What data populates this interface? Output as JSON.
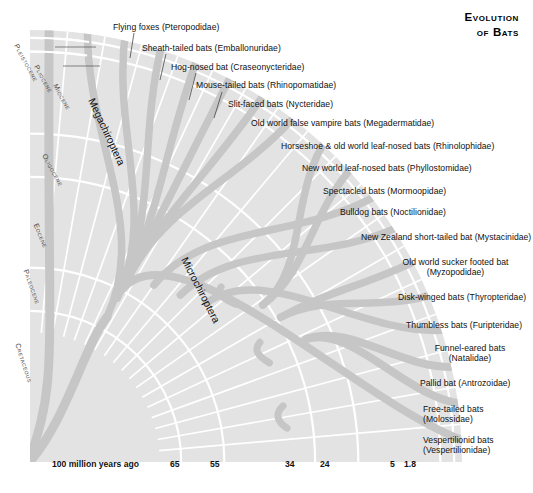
{
  "title": {
    "line1": "Evolution",
    "line2": "of Bats"
  },
  "clades": [
    {
      "name": "Megachiroptera"
    },
    {
      "name": "Microchiroptera"
    }
  ],
  "epochs": [
    {
      "label": "Pleistocene"
    },
    {
      "label": "Pliocene"
    },
    {
      "label": "Miocene"
    },
    {
      "label": "Oligocene"
    },
    {
      "label": "Eocene"
    },
    {
      "label": "Paleocene"
    },
    {
      "label": "Cretaceous"
    }
  ],
  "axis": {
    "origin_label": "100 million years ago",
    "ticks": [
      "65",
      "55",
      "34",
      "24",
      "5",
      "1.8"
    ]
  },
  "taxa": [
    {
      "common": "Flying foxes",
      "family": "(Pteropodidae)",
      "label": "Flying foxes (Pteropodidae)"
    },
    {
      "common": "Sheath-tailed bats",
      "family": "(Emballonuridae)",
      "label": "Sheath-tailed bats (Emballonuridae)"
    },
    {
      "common": "Hog-nosed bat",
      "family": "(Craseonycteridae)",
      "label": "Hog-nosed bat (Craseonycteridae)"
    },
    {
      "common": "Mouse-tailed bats",
      "family": "(Rhinopomatidae)",
      "label": "Mouse-tailed bats (Rhinopomatidae)"
    },
    {
      "common": "Slit-faced bats",
      "family": "(Nycteridae)",
      "label": "Slit-faced bats (Nycteridae)"
    },
    {
      "common": "Old world false vampire bats",
      "family": "(Megadermatidae)",
      "label": "Old world false vampire bats (Megadermatidae)"
    },
    {
      "common": "Horseshoe & old world leaf-nosed bats",
      "family": "(Rhinolophidae)",
      "label": "Horseshoe & old world leaf-nosed bats (Rhinolophidae)"
    },
    {
      "common": "New world leaf-nosed bats",
      "family": "(Phyllostomidae)",
      "label": "New world leaf-nosed bats (Phyllostomidae)"
    },
    {
      "common": "Spectacled bats",
      "family": "(Mormoopidae)",
      "label": "Spectacled bats (Mormoopidae)"
    },
    {
      "common": "Bulldog bats",
      "family": "(Noctilionidae)",
      "label": "Bulldog bats (Noctilionidae)"
    },
    {
      "common": "New Zealand short-tailed bat",
      "family": "(Mystacinidae)",
      "label": "New Zealand short-tailed bat (Mystacinidae)"
    },
    {
      "common": "Old world sucker footed bat",
      "family": "(Myzopodidae)",
      "label": "Old world sucker footed bat (Myzopodidae)"
    },
    {
      "common": "Disk-winged bats",
      "family": "(Thyropteridae)",
      "label": "Disk-winged bats (Thyropteridae)"
    },
    {
      "common": "Thumbless bats",
      "family": "(Furipteridae)",
      "label": "Thumbless bats (Furipteridae)"
    },
    {
      "common": "Funnel-eared bats",
      "family": "(Natalidae)",
      "label": "Funnel-eared bats (Natalidae)"
    },
    {
      "common": "Pallid bat",
      "family": "(Antrozoidae)",
      "label": "Pallid bat (Antrozoidae)"
    },
    {
      "common": "Free-tailed bats",
      "family": "(Molossidae)",
      "label": "Free-tailed bats (Molossidae)"
    },
    {
      "common": "Vespertilionid bats",
      "family": "(Vespertilionidae)",
      "label": "Vespertilionid bats (Vespertilionidae)"
    }
  ],
  "colors": {
    "background": "#ffffff",
    "fan_fill": "#e3e3e3",
    "branch": "#c6c6c6",
    "separator": "#ffffff",
    "text": "#111111",
    "epoch_text": "#4a4a4a"
  },
  "chart_data": {
    "type": "diagram",
    "subtype": "radial-phylogeny",
    "title": "Evolution of Bats",
    "time_axis_unit": "million years ago",
    "time_axis_range": [
      100,
      0
    ],
    "tick_values": [
      100,
      65,
      55,
      34,
      24,
      5,
      1.8
    ],
    "epoch_boundaries_mya": [
      {
        "name": "Cretaceous",
        "start": 100,
        "end": 65
      },
      {
        "name": "Paleocene",
        "start": 65,
        "end": 55
      },
      {
        "name": "Eocene",
        "start": 55,
        "end": 34
      },
      {
        "name": "Oligocene",
        "start": 34,
        "end": 24
      },
      {
        "name": "Miocene",
        "start": 24,
        "end": 5
      },
      {
        "name": "Pliocene",
        "start": 5,
        "end": 1.8
      },
      {
        "name": "Pleistocene",
        "start": 1.8,
        "end": 0
      }
    ],
    "tips": [
      "Flying foxes (Pteropodidae)",
      "Sheath-tailed bats (Emballonuridae)",
      "Hog-nosed bat (Craseonycteridae)",
      "Mouse-tailed bats (Rhinopomatidae)",
      "Slit-faced bats (Nycteridae)",
      "Old world false vampire bats (Megadermatidae)",
      "Horseshoe & old world leaf-nosed bats (Rhinolophidae)",
      "New world leaf-nosed bats (Phyllostomidae)",
      "Spectacled bats (Mormoopidae)",
      "Bulldog bats (Noctilionidae)",
      "New Zealand short-tailed bat (Mystacinidae)",
      "Old world sucker footed bat (Myzopodidae)",
      "Disk-winged bats (Thyropteridae)",
      "Thumbless bats (Furipteridae)",
      "Funnel-eared bats (Natalidae)",
      "Pallid bat (Antrozoidae)",
      "Free-tailed bats (Molossidae)",
      "Vespertilionid bats (Vespertilionidae)"
    ],
    "clades": [
      "Megachiroptera",
      "Microchiroptera"
    ]
  }
}
